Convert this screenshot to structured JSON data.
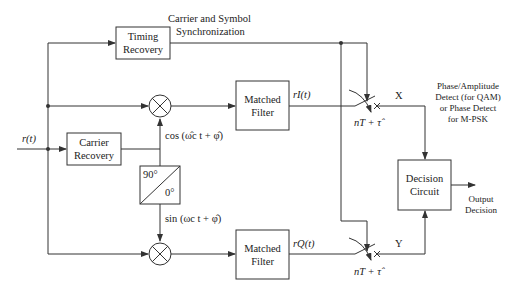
{
  "diagram": {
    "input": {
      "label": "r(t)"
    },
    "blocks": {
      "timing_recovery": {
        "line1": "Timing",
        "line2": "Recovery"
      },
      "carrier_recovery": {
        "line1": "Carrier",
        "line2": "Recovery"
      },
      "phase_shifter": {
        "top": "90°",
        "bottom": "0°"
      },
      "matched_filter_i": {
        "line1": "Matched",
        "line2": "Filter"
      },
      "matched_filter_q": {
        "line1": "Matched",
        "line2": "Filter"
      },
      "decision_circuit": {
        "line1": "Decision",
        "line2": "Circuit"
      }
    },
    "signals": {
      "cos_ref": "cos (ω̂c t + φ̂)",
      "sin_ref": "sin (ωc t + φ̂)",
      "r_i": "rI(t)",
      "r_q": "rQ(t)",
      "sample_i": "nT + τ̂",
      "sample_q": "nT + τ̂",
      "x_label": "X",
      "y_label": "Y"
    },
    "annotations": {
      "sync_line1": "Carrier and Symbol",
      "sync_line2": "Synchronization",
      "detect_line1": "Phase/Amplitude",
      "detect_line2": "Detect (for QAM)",
      "detect_line3": "or Phase Detect",
      "detect_line4": "for M-PSK",
      "output_line1": "Output",
      "output_line2": "Decision"
    },
    "colors": {
      "stroke": "#333333",
      "background": "#ffffff"
    }
  }
}
